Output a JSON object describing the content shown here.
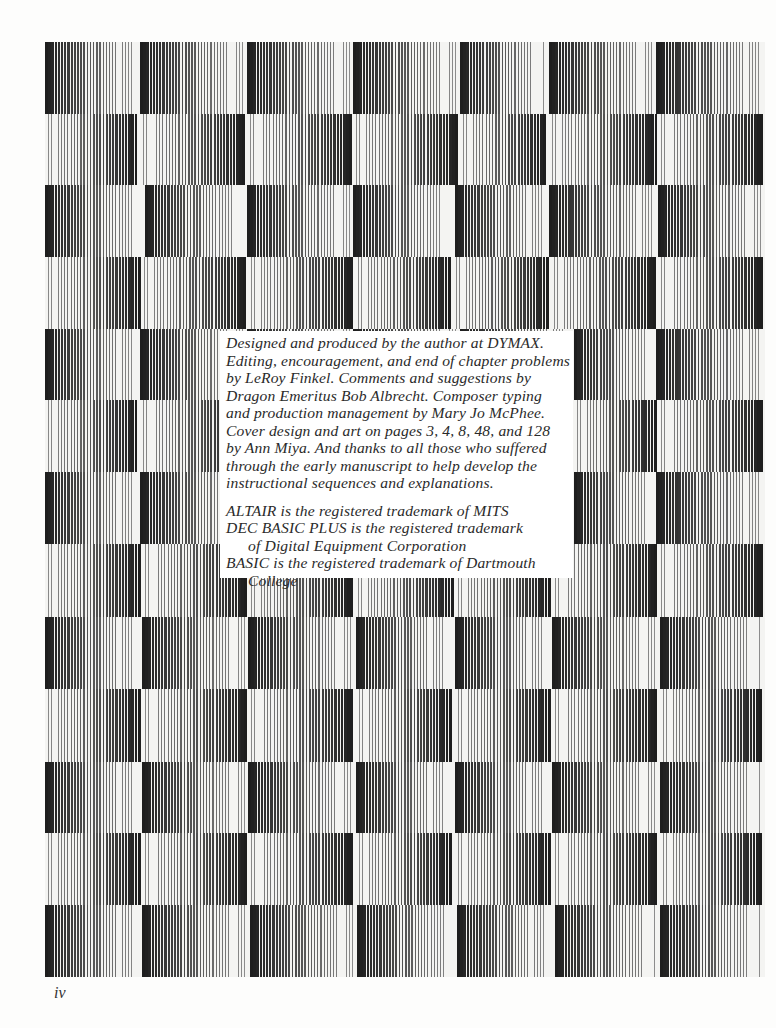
{
  "page": {
    "background": "#fdfdfc",
    "page_number": "iv"
  },
  "credits": {
    "paragraph_1": [
      "Designed and produced by the author at DYMAX.",
      "Editing, encouragement, and end of chapter problems",
      "by LeRoy Finkel.  Comments and suggestions by",
      "Dragon Emeritus Bob Albrecht.  Composer typing",
      "and production management by Mary Jo McPhee.",
      "Cover design and art on pages 3, 4, 8, 48, and 128",
      "by Ann Miya.  And thanks to all those who suffered",
      "through the early manuscript to help develop the",
      "instructional sequences and explanations."
    ],
    "trademarks": [
      {
        "text": "ALTAIR is the registered trademark of MITS",
        "indent": false
      },
      {
        "text": "DEC BASIC PLUS is the registered trademark",
        "indent": false
      },
      {
        "text": "of Digital Equipment Corporation",
        "indent": true
      },
      {
        "text": "BASIC is the registered trademark of Dartmouth",
        "indent": false
      },
      {
        "text": "College",
        "indent": true
      }
    ]
  },
  "decorative_pattern": {
    "description": "checkerboard of vertical-line gradient tiles",
    "dark_color": "#1e1e1e",
    "light_color": "#f4f4f2",
    "line_period_px": 3.2,
    "rows": [
      {
        "top": 42,
        "height": 72,
        "dir": "dark-left",
        "cols": [
          45,
          140,
          247,
          353,
          460,
          549,
          656,
          765
        ]
      },
      {
        "top": 114,
        "height": 71,
        "dir": "dark-right",
        "cols": [
          45,
          140,
          247,
          353,
          460,
          549,
          658,
          765
        ]
      },
      {
        "top": 185,
        "height": 72,
        "dir": "dark-left",
        "cols": [
          45,
          145,
          247,
          353,
          455,
          549,
          658,
          765
        ]
      },
      {
        "top": 257,
        "height": 72,
        "dir": "dark-right",
        "cols": [
          45,
          141,
          248,
          355,
          453,
          551,
          658,
          765
        ]
      },
      {
        "top": 329,
        "height": 71,
        "dir": "dark-left",
        "cols": [
          45,
          140,
          247,
          353,
          460,
          574,
          656,
          765
        ]
      },
      {
        "top": 400,
        "height": 72,
        "dir": "dark-right",
        "cols": [
          45,
          140,
          247,
          353,
          460,
          574,
          658,
          765
        ]
      },
      {
        "top": 472,
        "height": 72,
        "dir": "dark-left",
        "cols": [
          45,
          140,
          247,
          353,
          460,
          574,
          656,
          765
        ]
      },
      {
        "top": 544,
        "height": 73,
        "dir": "dark-right",
        "cols": [
          45,
          142,
          248,
          355,
          455,
          552,
          658,
          765
        ]
      },
      {
        "top": 617,
        "height": 72,
        "dir": "dark-left",
        "cols": [
          45,
          142,
          248,
          356,
          455,
          552,
          660,
          765
        ]
      },
      {
        "top": 689,
        "height": 73,
        "dir": "dark-right",
        "cols": [
          45,
          142,
          248,
          356,
          455,
          552,
          660,
          765
        ]
      },
      {
        "top": 762,
        "height": 71,
        "dir": "dark-left",
        "cols": [
          45,
          142,
          248,
          356,
          455,
          552,
          660,
          765
        ]
      },
      {
        "top": 833,
        "height": 72,
        "dir": "dark-right",
        "cols": [
          45,
          142,
          248,
          356,
          455,
          552,
          660,
          765
        ]
      },
      {
        "top": 905,
        "height": 72,
        "dir": "dark-left",
        "cols": [
          45,
          142,
          250,
          357,
          457,
          555,
          660,
          765
        ]
      }
    ]
  }
}
